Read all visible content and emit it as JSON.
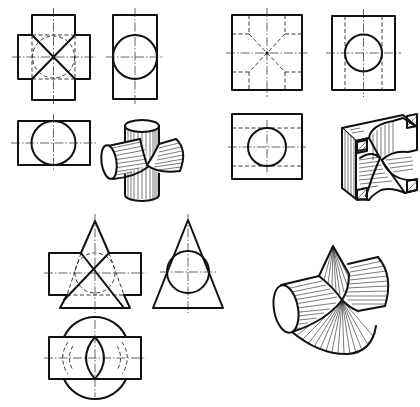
{
  "figure": {
    "background_color": "#ffffff",
    "line_color": "#111111",
    "groups": [
      {
        "id": "cylinder-cylinder",
        "description": "Two equal cylinders intersecting at right angles",
        "views": [
          "front-view",
          "side-view",
          "top-view",
          "isometric-view"
        ]
      },
      {
        "id": "block-with-cylindrical-cuts",
        "description": "Square block with intersecting cylindrical bores",
        "views": [
          "front-view",
          "side-view",
          "top-view",
          "isometric-view"
        ]
      },
      {
        "id": "cone-cylinder",
        "description": "Cone intersecting a horizontal cylinder",
        "views": [
          "front-view",
          "side-view",
          "top-view",
          "isometric-view"
        ]
      }
    ],
    "line_types": {
      "visible": "thick solid",
      "hidden": "dashed",
      "center": "dash-dot"
    }
  }
}
